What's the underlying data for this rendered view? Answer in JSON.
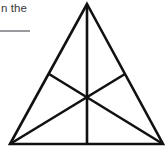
{
  "page": {
    "width": 167,
    "height": 152,
    "background_color": "#ffffff"
  },
  "text": {
    "fragment": "n the",
    "color": "#3a3a3c"
  },
  "rule": {
    "color": "#9a9a9e"
  },
  "figure": {
    "name": "triangle-with-medians",
    "stroke_color": "#111111",
    "stroke_width": 2.6,
    "fill": "none",
    "vertices": {
      "apex": [
        87,
        4
      ],
      "bottom_left": [
        10,
        144
      ],
      "bottom_right": [
        163,
        144
      ]
    },
    "midpoints": {
      "base": [
        87,
        144
      ],
      "left_side": [
        49,
        74
      ],
      "right_side": [
        125,
        74
      ]
    },
    "centroid": [
      87,
      97
    ],
    "outline_points": "87,4 163,144 10,144",
    "medians": [
      {
        "name": "median-apex-to-base",
        "from": [
          87,
          4
        ],
        "to": [
          87,
          144
        ]
      },
      {
        "name": "median-bottomleft-to-right-side",
        "from": [
          10,
          144
        ],
        "to": [
          125,
          74
        ]
      },
      {
        "name": "median-bottomright-to-left-side",
        "from": [
          163,
          144
        ],
        "to": [
          49,
          74
        ]
      }
    ]
  }
}
